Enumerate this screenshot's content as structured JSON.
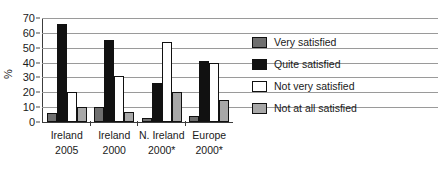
{
  "chart_data": {
    "type": "bar",
    "title": "",
    "xlabel": "",
    "ylabel": "%",
    "ylim": [
      0,
      70
    ],
    "yticks": [
      0,
      10,
      20,
      30,
      40,
      50,
      60,
      70
    ],
    "grid": true,
    "legend_position": "right",
    "categories": [
      "Ireland 2005",
      "Ireland 2000",
      "N. Ireland 2000*",
      "Europe 2000*"
    ],
    "category_lines": [
      [
        "Ireland",
        "2005"
      ],
      [
        "Ireland",
        "2000"
      ],
      [
        "N. Ireland",
        "2000*"
      ],
      [
        "Europe",
        "2000*"
      ]
    ],
    "series": [
      {
        "name": "Very satisfied",
        "color": "#6f6f6f",
        "values": [
          6,
          10,
          3,
          4
        ]
      },
      {
        "name": "Quite satisfied",
        "color": "#111111",
        "values": [
          66,
          55,
          26,
          41
        ]
      },
      {
        "name": "Not very satisfied",
        "color": "#ffffff",
        "values": [
          20,
          31,
          54,
          40
        ]
      },
      {
        "name": "Not at all satisfied",
        "color": "#a8a8a8",
        "values": [
          10,
          7,
          20,
          15
        ]
      }
    ]
  }
}
